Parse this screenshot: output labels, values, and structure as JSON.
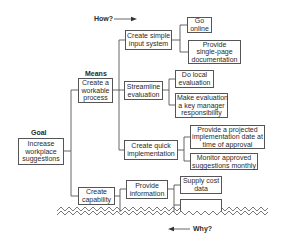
{
  "diagram": {
    "how_label": "How?",
    "why_label": "Why?",
    "goal": {
      "heading": "Goal",
      "lines": [
        "Increase",
        "workplace",
        "suggestions"
      ]
    },
    "means": {
      "heading": "Means",
      "nodes": [
        {
          "lines": [
            "Create a",
            "workable",
            "process"
          ],
          "children": [
            {
              "lines": [
                "Create simple",
                "input system"
              ],
              "children": [
                {
                  "lines": [
                    "Go",
                    "online"
                  ]
                },
                {
                  "lines": [
                    "Provide",
                    "single-page",
                    "documentation"
                  ]
                }
              ]
            },
            {
              "lines": [
                "Streamline",
                "evaluation"
              ],
              "children": [
                {
                  "lines": [
                    "Do local",
                    "evaluation"
                  ]
                },
                {
                  "lines": [
                    "Make evaluation",
                    "a key manager",
                    "responsibility"
                  ]
                }
              ]
            },
            {
              "lines": [
                "Create quick",
                "implementation"
              ],
              "children": [
                {
                  "lines": [
                    "Provide a projected",
                    "implementation date at",
                    "time of approval"
                  ]
                },
                {
                  "lines": [
                    "Monitor approved",
                    "suggestions monthly"
                  ]
                }
              ]
            }
          ]
        },
        {
          "lines": [
            "Create",
            "capability"
          ],
          "children": [
            {
              "lines": [
                "Provide",
                "information"
              ],
              "children": [
                {
                  "lines": [
                    "Supply cost",
                    "data"
                  ]
                },
                {
                  "lines": [
                    ""
                  ]
                }
              ]
            }
          ]
        }
      ]
    }
  }
}
